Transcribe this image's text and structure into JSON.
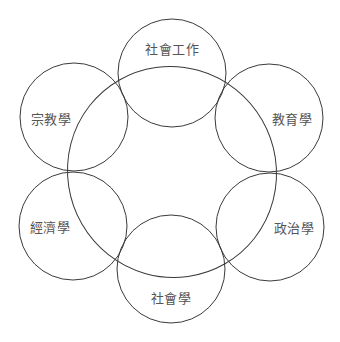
{
  "diagram": {
    "type": "venn-ring",
    "stroke_color": "#3a3a3a",
    "label_color": "#555555",
    "center_shape": {
      "name": "central-field",
      "cx": 172,
      "cy": 172,
      "rx": 104,
      "ry": 106,
      "rotate": -30
    },
    "nodes": [
      {
        "id": "social-work",
        "label": "社會工作",
        "cx": 172,
        "cy": 73,
        "r": 54,
        "lx": 172,
        "ly": 48
      },
      {
        "id": "religious-studies",
        "label": "宗教學",
        "cx": 74,
        "cy": 117,
        "r": 54,
        "lx": 51,
        "ly": 118
      },
      {
        "id": "education",
        "label": "教育學",
        "cx": 269,
        "cy": 118,
        "r": 54,
        "lx": 292,
        "ly": 118
      },
      {
        "id": "economics",
        "label": "經濟學",
        "cx": 73,
        "cy": 226,
        "r": 54,
        "lx": 50,
        "ly": 226
      },
      {
        "id": "political-science",
        "label": "政治學",
        "cx": 270,
        "cy": 227,
        "r": 54,
        "lx": 294,
        "ly": 227
      },
      {
        "id": "sociology",
        "label": "社會學",
        "cx": 171,
        "cy": 269,
        "r": 54,
        "lx": 171,
        "ly": 297
      }
    ]
  },
  "labels": {
    "top": "社會工作",
    "upper_left": "宗教學",
    "upper_right": "教育學",
    "lower_left": "經濟學",
    "lower_right": "政治學",
    "bottom": "社會學"
  }
}
